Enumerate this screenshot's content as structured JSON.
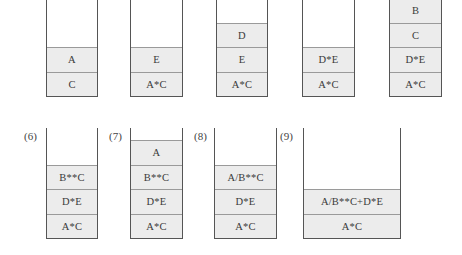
{
  "diagram": {
    "stacks": [
      {
        "label": "",
        "cells_bottom_to_top": [
          "C",
          "A"
        ]
      },
      {
        "label": "",
        "cells_bottom_to_top": [
          "A*C",
          "E"
        ]
      },
      {
        "label": "",
        "cells_bottom_to_top": [
          "A*C",
          "E",
          "D"
        ]
      },
      {
        "label": "",
        "cells_bottom_to_top": [
          "A*C",
          "D*E"
        ]
      },
      {
        "label": "",
        "cells_bottom_to_top": [
          "A*C",
          "D*E",
          "C",
          "B"
        ]
      },
      {
        "label": "(6)",
        "cells_bottom_to_top": [
          "A*C",
          "D*E",
          "B**C"
        ]
      },
      {
        "label": "(7)",
        "cells_bottom_to_top": [
          "A*C",
          "D*E",
          "B**C",
          "A"
        ]
      },
      {
        "label": "(8)",
        "cells_bottom_to_top": [
          "A*C",
          "D*E",
          "A/B**C"
        ]
      },
      {
        "label": "(9)",
        "cells_bottom_to_top": [
          "A*C",
          "A/B**C+D*E"
        ]
      }
    ]
  }
}
